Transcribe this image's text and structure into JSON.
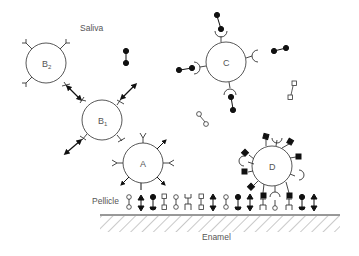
{
  "labels": {
    "saliva": "Saliva",
    "pellicle": "Pellicle",
    "enamel": "Enamel"
  },
  "cells": [
    {
      "id": "B2",
      "label": "B",
      "sub": "2",
      "cx": 42,
      "cy": 63,
      "r": 21
    },
    {
      "id": "B1",
      "label": "B",
      "sub": "1",
      "cx": 102,
      "cy": 120,
      "r": 21
    },
    {
      "id": "A",
      "label": "A",
      "cx": 143,
      "cy": 163,
      "r": 21
    },
    {
      "id": "C",
      "label": "C",
      "cx": 226,
      "cy": 63,
      "r": 21
    },
    {
      "id": "D",
      "label": "D",
      "cx": 272,
      "cy": 165,
      "r": 21
    }
  ],
  "colors": {
    "line": "#333333",
    "text": "#555555",
    "fill_dark": "#111111",
    "background": "#ffffff"
  }
}
